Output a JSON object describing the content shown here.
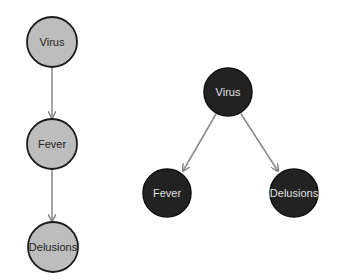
{
  "colors": {
    "chain_fill": "#bdbdbd",
    "chain_stroke": "#1a1a1a",
    "chain_text": "#222222",
    "fork_fill": "#222222",
    "fork_stroke": "#111111",
    "fork_text": "#e0e0e0",
    "edge": "#888888"
  },
  "chain_diagram": {
    "nodes": [
      {
        "id": "virus",
        "label": "Virus"
      },
      {
        "id": "fever",
        "label": "Fever"
      },
      {
        "id": "delusions",
        "label": "Delusions"
      }
    ],
    "edges": [
      {
        "from": "virus",
        "to": "fever"
      },
      {
        "from": "fever",
        "to": "delusions"
      }
    ]
  },
  "fork_diagram": {
    "nodes": [
      {
        "id": "virus",
        "label": "Virus"
      },
      {
        "id": "fever",
        "label": "Fever"
      },
      {
        "id": "delusions",
        "label": "Delusions"
      }
    ],
    "edges": [
      {
        "from": "virus",
        "to": "fever"
      },
      {
        "from": "virus",
        "to": "delusions"
      }
    ]
  }
}
